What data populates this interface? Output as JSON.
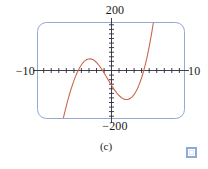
{
  "figure": {
    "caption": "(c)",
    "marker_icon": "blue-square-icon",
    "frame_color": "#93a9d6",
    "curve_color": "#c96a4e",
    "axis_color": "#2a2a3a"
  },
  "labels": {
    "y_max": "200",
    "y_min": "−200",
    "x_min": "−10",
    "x_max": "10"
  },
  "chart_data": {
    "type": "line",
    "title": "",
    "subtitle": "(c)",
    "xlabel": "",
    "ylabel": "",
    "xlim": [
      -10,
      10
    ],
    "ylim": [
      -200,
      200
    ],
    "grid": false,
    "legend": "none",
    "x_ticks": [
      -9,
      -8,
      -7,
      -6,
      -5,
      -4,
      -3,
      -2,
      -1,
      1,
      2,
      3,
      4,
      5,
      6,
      7,
      8,
      9
    ],
    "y_ticks": [
      -180,
      -160,
      -140,
      -120,
      -100,
      -80,
      -60,
      -40,
      -20,
      20,
      40,
      60,
      80,
      100,
      120,
      140,
      160,
      180
    ],
    "x_tick_labels": [
      "−10",
      "10"
    ],
    "y_tick_labels": [
      "200",
      "−200"
    ],
    "annotations": [
      "roots near x = -5, 0, 5",
      "local maximum near x = -3",
      "local minimum near x = 3"
    ],
    "series": [
      {
        "name": "cubic",
        "color": "#c96a4e",
        "x": [
          -6.7,
          -6.4,
          -6.1,
          -5.8,
          -5.5,
          -5.2,
          -4.9,
          -4.6,
          -4.3,
          -4.0,
          -3.7,
          -3.4,
          -3.1,
          -2.8,
          -2.5,
          -2.2,
          -1.9,
          -1.6,
          -1.3,
          -1.0,
          -0.7,
          -0.4,
          -0.1,
          0.2,
          0.5,
          0.8,
          1.1,
          1.4,
          1.7,
          2.0,
          2.3,
          2.6,
          2.9,
          3.2,
          3.5,
          3.8,
          4.1,
          4.4,
          4.7,
          5.0,
          5.3,
          5.6,
          5.9,
          6.2,
          6.5,
          6.8
        ],
        "y": [
          -223.3,
          -183.5,
          -146.5,
          -112.3,
          -81.1,
          -53.0,
          -28.0,
          -6.4,
          11.8,
          26.4,
          37.4,
          44.8,
          48.6,
          49.0,
          46.1,
          40.1,
          31.3,
          20.1,
          7.0,
          -7.5,
          -22.8,
          -38.4,
          -53.8,
          -68.7,
          -82.5,
          -94.9,
          -105.4,
          -113.7,
          -119.5,
          -122.4,
          -122.1,
          -118.4,
          -111.0,
          -99.6,
          -84.0,
          -63.9,
          -39.2,
          -9.6,
          25.0,
          65.0,
          110.7,
          162.3,
          220.0,
          284.2,
          355.2,
          433.1
        ]
      }
    ]
  }
}
